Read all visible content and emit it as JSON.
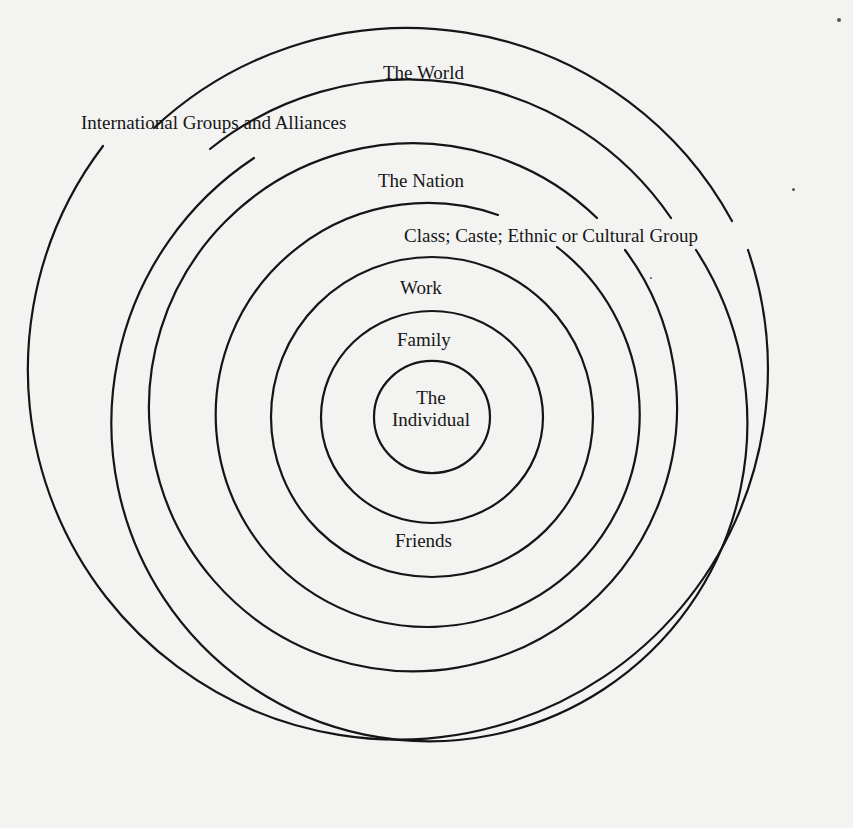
{
  "diagram": {
    "type": "concentric-circles",
    "colors": {
      "background": "#f3f3f1",
      "stroke": "#151515",
      "text": "#161616"
    },
    "rings": [
      {
        "level": 1,
        "label_line1": "The",
        "label_line2": "Individual"
      },
      {
        "level": 2,
        "label": "Family"
      },
      {
        "level": 3,
        "label": "Work",
        "label_bottom": "Friends"
      },
      {
        "level": 4,
        "label": "Class; Caste; Ethnic or Cultural Group"
      },
      {
        "level": 5,
        "label": "The Nation"
      },
      {
        "level": 6,
        "label": "International Groups and Alliances"
      },
      {
        "level": 7,
        "label": "The World"
      }
    ]
  }
}
